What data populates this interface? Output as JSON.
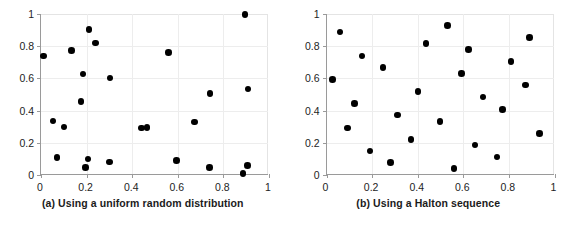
{
  "figure": {
    "background_color": "#ffffff",
    "marker_color": "#000000",
    "axis_color": "#9a9a9a",
    "grid_color": "#ededed"
  },
  "panels": [
    {
      "id": "a",
      "caption": "(a) Using a uniform random distribution",
      "chart_data": {
        "type": "scatter",
        "title": "(a) Using a uniform random distribution",
        "xlabel": "",
        "ylabel": "",
        "xlim": [
          0,
          1
        ],
        "ylim": [
          0,
          1
        ],
        "xticks": [
          0,
          0.2,
          0.4,
          0.6,
          0.8,
          1
        ],
        "yticks": [
          0,
          0.2,
          0.4,
          0.6,
          0.8,
          1
        ],
        "xticklabels": [
          "0",
          "0.2",
          "0.4",
          "0.6",
          "0.8",
          "1"
        ],
        "yticklabels": [
          "0",
          "0.2",
          "0.4",
          "0.6",
          "0.8",
          "1"
        ],
        "grid": true,
        "legend": null,
        "marker": "filled-circle",
        "n_points": 24,
        "points": [
          [
            0.01,
            0.74
          ],
          [
            0.052,
            0.335
          ],
          [
            0.07,
            0.11
          ],
          [
            0.1,
            0.298
          ],
          [
            0.135,
            0.775
          ],
          [
            0.175,
            0.455
          ],
          [
            0.185,
            0.628
          ],
          [
            0.195,
            0.046
          ],
          [
            0.206,
            0.1
          ],
          [
            0.21,
            0.905
          ],
          [
            0.24,
            0.82
          ],
          [
            0.3,
            0.08
          ],
          [
            0.302,
            0.602
          ],
          [
            0.44,
            0.291
          ],
          [
            0.465,
            0.295
          ],
          [
            0.56,
            0.76
          ],
          [
            0.595,
            0.09
          ],
          [
            0.672,
            0.33
          ],
          [
            0.74,
            0.046
          ],
          [
            0.742,
            0.505
          ],
          [
            0.886,
            0.01
          ],
          [
            0.895,
            0.998
          ],
          [
            0.905,
            0.06
          ],
          [
            0.908,
            0.534
          ]
        ]
      }
    },
    {
      "id": "b",
      "caption": "(b) Using a Halton sequence",
      "chart_data": {
        "type": "scatter",
        "title": "(b) Using a Halton sequence",
        "xlabel": "",
        "ylabel": "",
        "xlim": [
          0,
          1
        ],
        "ylim": [
          0,
          1
        ],
        "xticks": [
          0,
          0.2,
          0.4,
          0.6,
          0.8,
          1
        ],
        "yticks": [
          0,
          0.2,
          0.4,
          0.6,
          0.8,
          1
        ],
        "xticklabels": [
          "0",
          "0.2",
          "0.4",
          "0.6",
          "0.8",
          "1"
        ],
        "yticklabels": [
          "0",
          "0.2",
          "0.4",
          "0.6",
          "0.8",
          "1"
        ],
        "grid": true,
        "legend": null,
        "marker": "filled-circle",
        "n_points": 24,
        "points": [
          [
            0.026,
            0.592
          ],
          [
            0.06,
            0.888
          ],
          [
            0.092,
            0.292
          ],
          [
            0.124,
            0.445
          ],
          [
            0.156,
            0.74
          ],
          [
            0.19,
            0.148
          ],
          [
            0.248,
            0.668
          ],
          [
            0.28,
            0.076
          ],
          [
            0.312,
            0.372
          ],
          [
            0.37,
            0.222
          ],
          [
            0.402,
            0.518
          ],
          [
            0.436,
            0.815
          ],
          [
            0.498,
            0.332
          ],
          [
            0.53,
            0.93
          ],
          [
            0.56,
            0.04
          ],
          [
            0.592,
            0.632
          ],
          [
            0.624,
            0.78
          ],
          [
            0.652,
            0.186
          ],
          [
            0.686,
            0.484
          ],
          [
            0.748,
            0.112
          ],
          [
            0.772,
            0.408
          ],
          [
            0.81,
            0.706
          ],
          [
            0.874,
            0.558
          ],
          [
            0.89,
            0.854
          ],
          [
            0.934,
            0.256
          ]
        ]
      }
    }
  ]
}
